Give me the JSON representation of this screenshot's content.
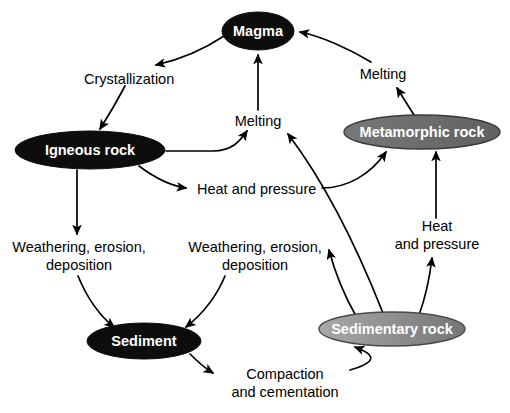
{
  "diagram": {
    "background_color": "#ffffff",
    "nodes": [
      {
        "id": "magma",
        "label": "Magma",
        "fill": "#0d0d0d",
        "text_color": "#ffffff",
        "cx": 258,
        "cy": 31,
        "rx": 36,
        "ry": 19,
        "font_size": 14.5
      },
      {
        "id": "igneous-rock",
        "label": "Igneous rock",
        "fill": "#0d0d0d",
        "text_color": "#ffffff",
        "cx": 90,
        "cy": 150,
        "rx": 75,
        "ry": 19,
        "font_size": 14.5
      },
      {
        "id": "metamorphic-rock",
        "label": "Metamorphic rock",
        "fill": "#6e6e6e",
        "text_color": "#ffffff",
        "cx": 422,
        "cy": 132,
        "rx": 78,
        "ry": 17,
        "font_size": 14.5
      },
      {
        "id": "sediment",
        "label": "Sediment",
        "fill": "#0d0d0d",
        "text_color": "#ffffff",
        "cx": 144,
        "cy": 341,
        "rx": 57,
        "ry": 18,
        "font_size": 14.5
      },
      {
        "id": "sedimentary-rock",
        "label": "Sedimentary rock",
        "fill": "#8a8a8a",
        "text_color": "#ffffff",
        "cx": 392,
        "cy": 329,
        "rx": 73,
        "ry": 17,
        "font_size": 14.5
      }
    ],
    "edge_labels": [
      {
        "id": "crystallization",
        "text": "Crystallization",
        "x": 84,
        "y": 78,
        "anchor": "start",
        "lines": [
          "Crystallization"
        ]
      },
      {
        "id": "melting-center",
        "text": "Melting",
        "x": 258,
        "y": 121,
        "anchor": "middle",
        "lines": [
          "Melting"
        ]
      },
      {
        "id": "melting-right",
        "text": "Melting",
        "x": 383,
        "y": 74,
        "anchor": "middle",
        "lines": [
          "Melting"
        ]
      },
      {
        "id": "heat-and-pressure-center",
        "text": "Heat and pressure",
        "x": 197,
        "y": 192,
        "anchor": "start",
        "lines": [
          "Heat and pressure"
        ]
      },
      {
        "id": "heat-and-pressure-right",
        "text": "Heat and pressure",
        "x": 437,
        "y": 229,
        "anchor": "middle",
        "lines": [
          "Heat",
          "and pressure"
        ]
      },
      {
        "id": "weathering-erosion-deposition-left",
        "text": "Weathering, erosion, deposition",
        "x": 79,
        "y": 249,
        "anchor": "middle",
        "lines": [
          "Weathering, erosion,",
          "deposition"
        ]
      },
      {
        "id": "weathering-erosion-deposition-right",
        "text": "Weathering, erosion, deposition",
        "x": 255,
        "y": 249,
        "anchor": "middle",
        "lines": [
          "Weathering, erosion,",
          "deposition"
        ]
      },
      {
        "id": "compaction-and-cementation",
        "text": "Compaction and cementation",
        "x": 285,
        "y": 378,
        "anchor": "middle",
        "lines": [
          "Compaction",
          "and cementation"
        ]
      }
    ],
    "edges": [
      {
        "id": "magma-to-crystallization",
        "from": "magma",
        "to": "crystallization",
        "label": "Crystallization"
      },
      {
        "id": "crystallization-to-igneous",
        "from": "crystallization",
        "to": "igneous-rock",
        "label": "Crystallization"
      },
      {
        "id": "igneous-to-melting",
        "from": "igneous-rock",
        "to": "melting-center",
        "label": "Melting"
      },
      {
        "id": "melting-to-magma",
        "from": "melting-center",
        "to": "magma",
        "label": "Melting"
      },
      {
        "id": "igneous-to-heat-and-pressure",
        "from": "igneous-rock",
        "to": "heat-and-pressure-center",
        "label": "Heat and pressure"
      },
      {
        "id": "heat-and-pressure-to-metamorphic",
        "from": "heat-and-pressure-center",
        "to": "metamorphic-rock",
        "label": "Heat and pressure"
      },
      {
        "id": "metamorphic-to-melting-right",
        "from": "metamorphic-rock",
        "to": "melting-right",
        "label": "Melting"
      },
      {
        "id": "melting-right-to-magma",
        "from": "melting-right",
        "to": "magma",
        "label": "Melting"
      },
      {
        "id": "igneous-to-weathering-left",
        "from": "igneous-rock",
        "to": "weathering-erosion-deposition-left",
        "label": "Weathering, erosion, deposition"
      },
      {
        "id": "weathering-left-to-sediment",
        "from": "weathering-erosion-deposition-left",
        "to": "sediment",
        "label": "Weathering, erosion, deposition"
      },
      {
        "id": "sedimentary-to-weathering-right",
        "from": "sedimentary-rock",
        "to": "weathering-erosion-deposition-right",
        "label": "Weathering, erosion, deposition"
      },
      {
        "id": "weathering-right-to-sediment",
        "from": "weathering-erosion-deposition-right",
        "to": "sediment",
        "label": "Weathering, erosion, deposition"
      },
      {
        "id": "sediment-to-compaction",
        "from": "sediment",
        "to": "compaction-and-cementation",
        "label": "Compaction and cementation"
      },
      {
        "id": "compaction-to-sedimentary",
        "from": "compaction-and-cementation",
        "to": "sedimentary-rock",
        "label": "Compaction and cementation"
      },
      {
        "id": "sedimentary-to-heat-and-pressure-right",
        "from": "sedimentary-rock",
        "to": "heat-and-pressure-right",
        "label": "Heat and pressure"
      },
      {
        "id": "heat-and-pressure-right-to-metamorphic",
        "from": "heat-and-pressure-right",
        "to": "metamorphic-rock",
        "label": "Heat and pressure"
      },
      {
        "id": "sedimentary-to-melting-center",
        "from": "sedimentary-rock",
        "to": "melting-center",
        "label": "Melting"
      }
    ]
  }
}
